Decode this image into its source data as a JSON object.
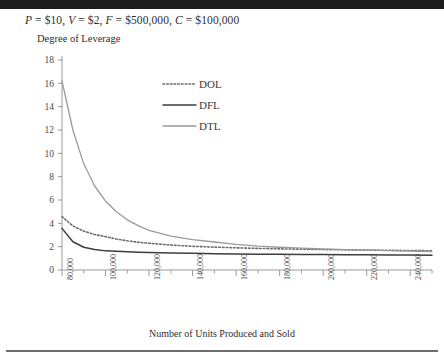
{
  "header": {
    "assumption_line": "P = $10, V = $2, F = $500,000, C = $100,000",
    "parts": {
      "p_sym": "P",
      "p_val": " = $10, ",
      "v_sym": "V",
      "v_val": " = $2, ",
      "f_sym": "F",
      "f_val": " = $500,000, ",
      "c_sym": "C",
      "c_val": " = $100,000"
    }
  },
  "chart_data": {
    "type": "line",
    "title": "",
    "subtitle": "P = $10, V = $2, F = $500,000, C = $100,000",
    "xlabel": "Number of Units Produced and Sold",
    "ylabel": "Degree of Leverage",
    "xlim": [
      80000,
      250000
    ],
    "ylim": [
      0,
      18
    ],
    "yticks": [
      0,
      2,
      4,
      6,
      8,
      10,
      12,
      14,
      16,
      18
    ],
    "ytick_labels": [
      "0",
      "2",
      "4",
      "6",
      "8",
      "10",
      "12",
      "14",
      "16",
      "18"
    ],
    "xticks": [
      80000,
      100000,
      120000,
      140000,
      160000,
      180000,
      200000,
      220000,
      240000
    ],
    "xtick_labels": [
      "80,000",
      "100,000",
      "120,000",
      "140,000",
      "160,000",
      "180,000",
      "200,000",
      "220,000",
      "240,000"
    ],
    "x_minor_interval": 10000,
    "grid": false,
    "legend_position": "upper-center",
    "x": [
      80000,
      85000,
      90000,
      95000,
      100000,
      105000,
      110000,
      115000,
      120000,
      130000,
      140000,
      150000,
      160000,
      170000,
      180000,
      190000,
      200000,
      210000,
      220000,
      230000,
      240000,
      250000
    ],
    "series": [
      {
        "name": "DOL",
        "style": "dotted",
        "color": "#6b6b6b",
        "width": 1.6,
        "values": [
          4.57,
          3.78,
          3.33,
          3.04,
          2.86,
          2.65,
          2.5,
          2.38,
          2.29,
          2.14,
          2.03,
          1.96,
          1.9,
          1.85,
          1.81,
          1.78,
          1.75,
          1.73,
          1.71,
          1.69,
          1.67,
          1.65
        ]
      },
      {
        "name": "DFL",
        "style": "solid",
        "color": "#3d3d3d",
        "width": 1.5,
        "values": [
          3.57,
          2.42,
          1.95,
          1.76,
          1.64,
          1.6,
          1.56,
          1.53,
          1.5,
          1.46,
          1.43,
          1.4,
          1.38,
          1.36,
          1.35,
          1.33,
          1.32,
          1.31,
          1.3,
          1.29,
          1.28,
          1.27
        ]
      },
      {
        "name": "DTL",
        "style": "solid",
        "color": "#9a9a9a",
        "width": 1.3,
        "values": [
          16.2,
          12.0,
          9.1,
          7.2,
          5.9,
          5.0,
          4.3,
          3.8,
          3.4,
          2.9,
          2.6,
          2.4,
          2.2,
          2.05,
          1.95,
          1.87,
          1.8,
          1.75,
          1.7,
          1.66,
          1.62,
          1.58
        ]
      }
    ],
    "legend": [
      {
        "label": "DOL",
        "style": "dotted",
        "color": "#6b6b6b"
      },
      {
        "label": "DFL",
        "style": "solid",
        "color": "#3d3d3d"
      },
      {
        "label": "DTL",
        "style": "solid",
        "color": "#9a9a9a"
      }
    ]
  }
}
